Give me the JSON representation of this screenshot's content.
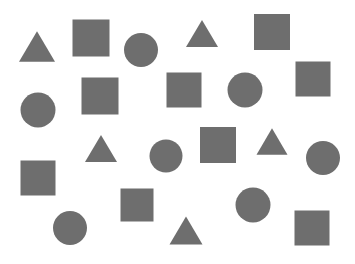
{
  "figure": {
    "width": 355,
    "height": 264,
    "background_color": "#ffffff",
    "shape_fill_color": "#6e6e6e",
    "shape_counts": {
      "triangle": 5,
      "square": 9,
      "circle": 8,
      "total": 22
    }
  },
  "chart_data": {
    "type": "scatter",
    "xlabel": "",
    "ylabel": "",
    "xlim": [
      0,
      355
    ],
    "ylim": [
      0,
      264
    ],
    "grid": false,
    "legend": "none",
    "marker_color": "#6e6e6e",
    "categories": [
      "triangle",
      "square",
      "circle"
    ],
    "values": [
      5,
      9,
      8
    ],
    "series": [
      {
        "name": "triangle",
        "marker": "triangle",
        "count": 5,
        "points": [
          {
            "id": "triangle-1",
            "cx": 37,
            "cy": 47,
            "size": 36
          },
          {
            "id": "triangle-2",
            "cx": 202,
            "cy": 34,
            "size": 32
          },
          {
            "id": "triangle-3",
            "cx": 101,
            "cy": 149,
            "size": 32
          },
          {
            "id": "triangle-4",
            "cx": 272,
            "cy": 142,
            "size": 31
          },
          {
            "id": "triangle-5",
            "cx": 186,
            "cy": 231,
            "size": 33
          }
        ]
      },
      {
        "name": "square",
        "marker": "square",
        "count": 9,
        "points": [
          {
            "id": "square-1",
            "cx": 91,
            "cy": 38,
            "size": 37
          },
          {
            "id": "square-2",
            "cx": 272,
            "cy": 32,
            "size": 36
          },
          {
            "id": "square-3",
            "cx": 100,
            "cy": 96,
            "size": 37
          },
          {
            "id": "square-4",
            "cx": 184,
            "cy": 90,
            "size": 35
          },
          {
            "id": "square-5",
            "cx": 313,
            "cy": 79,
            "size": 35
          },
          {
            "id": "square-6",
            "cx": 218,
            "cy": 145,
            "size": 36
          },
          {
            "id": "square-7",
            "cx": 38,
            "cy": 178,
            "size": 35
          },
          {
            "id": "square-8",
            "cx": 137,
            "cy": 205,
            "size": 33
          },
          {
            "id": "square-9",
            "cx": 312,
            "cy": 228,
            "size": 35
          }
        ]
      },
      {
        "name": "circle",
        "marker": "circle",
        "count": 8,
        "points": [
          {
            "id": "circle-1",
            "cx": 141,
            "cy": 50,
            "size": 34
          },
          {
            "id": "circle-2",
            "cx": 245,
            "cy": 90,
            "size": 35
          },
          {
            "id": "circle-3",
            "cx": 38,
            "cy": 110,
            "size": 35
          },
          {
            "id": "circle-4",
            "cx": 166,
            "cy": 156,
            "size": 33
          },
          {
            "id": "circle-5",
            "cx": 323,
            "cy": 158,
            "size": 34
          },
          {
            "id": "circle-6",
            "cx": 70,
            "cy": 228,
            "size": 34
          },
          {
            "id": "circle-7",
            "cx": 253,
            "cy": 205,
            "size": 35
          },
          {
            "id": "circle-8",
            "cx": 141,
            "cy": 50,
            "size": 0
          }
        ]
      }
    ]
  }
}
